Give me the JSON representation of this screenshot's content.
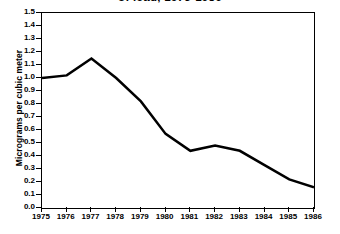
{
  "chart_data": {
    "type": "line",
    "title": "of lead, 1975-1986",
    "title_full": "of lead, 1975-1986",
    "xlabel": "",
    "ylabel": "Micrograms per cubic meter",
    "categories": [
      "1975",
      "1976",
      "1977",
      "1978",
      "1979",
      "1980",
      "1981",
      "1982",
      "1983",
      "1984",
      "1985",
      "1986"
    ],
    "x": [
      1975,
      1976,
      1977,
      1978,
      1979,
      1980,
      1981,
      1982,
      1983,
      1984,
      1985,
      1986
    ],
    "values": [
      1.0,
      1.02,
      1.15,
      1.0,
      0.82,
      0.57,
      0.44,
      0.48,
      0.44,
      0.33,
      0.22,
      0.16
    ],
    "series": [
      {
        "name": "Lead concentration",
        "values": [
          1.0,
          1.02,
          1.15,
          1.0,
          0.82,
          0.57,
          0.44,
          0.48,
          0.44,
          0.33,
          0.22,
          0.16
        ],
        "color": "#000000"
      }
    ],
    "ylim": [
      0.0,
      1.5
    ],
    "xlim": [
      1975,
      1986
    ],
    "yticks": [
      "0.0",
      "0.1",
      "0.2",
      "0.3",
      "0.4",
      "0.5",
      "0.6",
      "0.7",
      "0.8",
      "0.9",
      "1.0",
      "1.1",
      "1.2",
      "1.3",
      "1.4",
      "1.5"
    ],
    "ytick_values": [
      0.0,
      0.1,
      0.2,
      0.3,
      0.4,
      0.5,
      0.6,
      0.7,
      0.8,
      0.9,
      1.0,
      1.1,
      1.2,
      1.3,
      1.4,
      1.5
    ],
    "xticks": [
      "1975",
      "1976",
      "1977",
      "1978",
      "1979",
      "1980",
      "1981",
      "1982",
      "1983",
      "1984",
      "1985",
      "1986"
    ],
    "grid": false,
    "legend": false,
    "legend_position": "none",
    "line_color": "#000000",
    "line_width": 2.5,
    "background_color": "#ffffff",
    "frame_color": "#000000"
  }
}
